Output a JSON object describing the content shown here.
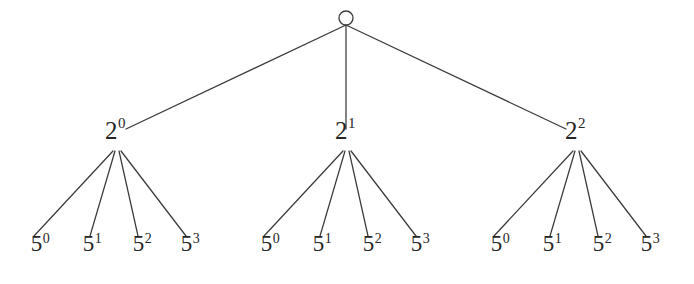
{
  "diagram": {
    "type": "tree-diagram",
    "background_color": "#ffffff",
    "line_color": "#3b3b3b",
    "text_color": "#262626",
    "root": {
      "label": "",
      "shape": "circle",
      "cx": 346,
      "cy": 18,
      "r": 7
    },
    "level2": [
      {
        "base": "2",
        "exponent": "0",
        "x": 115,
        "y": 143
      },
      {
        "base": "2",
        "exponent": "1",
        "x": 345,
        "y": 143
      },
      {
        "base": "2",
        "exponent": "2",
        "x": 575,
        "y": 143
      }
    ],
    "leaves": [
      [
        {
          "base": "5",
          "exponent": "0",
          "x": 40,
          "y": 255
        },
        {
          "base": "5",
          "exponent": "1",
          "x": 92,
          "y": 255
        },
        {
          "base": "5",
          "exponent": "2",
          "x": 142,
          "y": 255
        },
        {
          "base": "5",
          "exponent": "3",
          "x": 190,
          "y": 255
        }
      ],
      [
        {
          "base": "5",
          "exponent": "0",
          "x": 270,
          "y": 255
        },
        {
          "base": "5",
          "exponent": "1",
          "x": 322,
          "y": 255
        },
        {
          "base": "5",
          "exponent": "2",
          "x": 372,
          "y": 255
        },
        {
          "base": "5",
          "exponent": "3",
          "x": 420,
          "y": 255
        }
      ],
      [
        {
          "base": "5",
          "exponent": "0",
          "x": 500,
          "y": 255
        },
        {
          "base": "5",
          "exponent": "1",
          "x": 552,
          "y": 255
        },
        {
          "base": "5",
          "exponent": "2",
          "x": 602,
          "y": 255
        },
        {
          "base": "5",
          "exponent": "3",
          "x": 650,
          "y": 255
        }
      ]
    ],
    "edges_level1": [
      {
        "x1": 346,
        "y1": 25,
        "x2": 126,
        "y2": 129
      },
      {
        "x1": 346,
        "y1": 25,
        "x2": 346,
        "y2": 129
      },
      {
        "x1": 346,
        "y1": 25,
        "x2": 566,
        "y2": 129
      }
    ],
    "edges_level2": [
      {
        "x1": 113,
        "y1": 151,
        "x2": 34,
        "y2": 236
      },
      {
        "x1": 115,
        "y1": 151,
        "x2": 90,
        "y2": 236
      },
      {
        "x1": 119,
        "y1": 151,
        "x2": 138,
        "y2": 236
      },
      {
        "x1": 121,
        "y1": 151,
        "x2": 186,
        "y2": 236
      },
      {
        "x1": 343,
        "y1": 151,
        "x2": 264,
        "y2": 236
      },
      {
        "x1": 345,
        "y1": 151,
        "x2": 320,
        "y2": 236
      },
      {
        "x1": 349,
        "y1": 151,
        "x2": 368,
        "y2": 236
      },
      {
        "x1": 351,
        "y1": 151,
        "x2": 416,
        "y2": 236
      },
      {
        "x1": 573,
        "y1": 151,
        "x2": 494,
        "y2": 236
      },
      {
        "x1": 575,
        "y1": 151,
        "x2": 550,
        "y2": 236
      },
      {
        "x1": 579,
        "y1": 151,
        "x2": 598,
        "y2": 236
      },
      {
        "x1": 581,
        "y1": 151,
        "x2": 646,
        "y2": 236
      }
    ]
  }
}
